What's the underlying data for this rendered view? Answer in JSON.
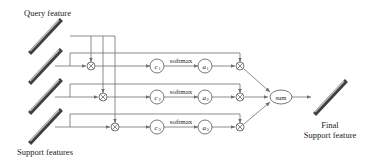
{
  "diagram": {
    "labels": {
      "query_feature": "Query feature",
      "support_features": "Support features",
      "final_line1": "Final",
      "final_line2": "Support feature",
      "sum": "sum"
    },
    "branches": [
      {
        "c": "c",
        "c_sub": "1",
        "softmax": "softmax",
        "a": "a",
        "a_sub": "1"
      },
      {
        "c": "c",
        "c_sub": "2",
        "softmax": "softmax",
        "a": "a",
        "a_sub": "2"
      },
      {
        "c": "c",
        "c_sub": "3",
        "softmax": "softmax",
        "a": "a",
        "a_sub": "3"
      }
    ],
    "operators": {
      "multiply": "⊗"
    },
    "colors": {
      "line": "#6e6e6e",
      "bar_dark": "#4a4a4a",
      "bar_light": "#b5b5b5",
      "text": "#222222"
    }
  }
}
